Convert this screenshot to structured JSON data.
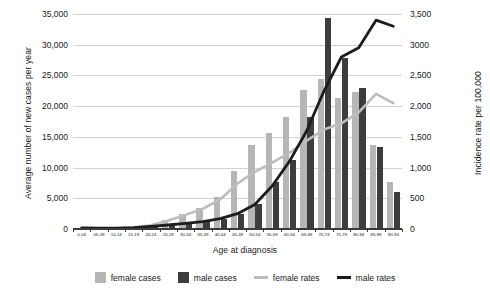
{
  "chart_data": {
    "type": "bar",
    "title": "",
    "xlabel": "Age at diagnosis",
    "ylabel": "Average number of new cases per year",
    "y2label": "Incidence rate per 100,000",
    "ylim": [
      0,
      35000
    ],
    "y2lim": [
      0,
      3500
    ],
    "grid": true,
    "legend_position": "bottom",
    "categories": [
      "0-04",
      "05-09",
      "10-14",
      "15-19",
      "20-24",
      "25-29",
      "30-34",
      "35-39",
      "40-44",
      "45-49",
      "50-54",
      "55-59",
      "60-64",
      "65-69",
      "70-74",
      "75-79",
      "80-84",
      "85-89",
      "90-94"
    ],
    "yticks": [
      "0",
      "5,000",
      "10,000",
      "15,000",
      "20,000",
      "25,000",
      "30,000",
      "35,000"
    ],
    "y2ticks": [
      "0",
      "500",
      "1,000",
      "1,500",
      "2,000",
      "2,500",
      "3000",
      "3,500"
    ],
    "series": [
      {
        "name": "female cases",
        "type": "bar",
        "axis": "left",
        "color": "#b6b6b6",
        "values": [
          130,
          90,
          110,
          250,
          600,
          1450,
          2400,
          3500,
          5200,
          9500,
          13700,
          15600,
          18200,
          22700,
          24400,
          21400,
          22300,
          13700,
          7600
        ]
      },
      {
        "name": "male cases",
        "type": "bar",
        "axis": "left",
        "color": "#3d3d3d",
        "values": [
          160,
          110,
          130,
          250,
          450,
          700,
          950,
          1250,
          1700,
          2400,
          4000,
          7700,
          11200,
          18300,
          34300,
          27800,
          23000,
          13300,
          6000
        ]
      },
      {
        "name": "female rates",
        "type": "line",
        "axis": "right",
        "color": "#bdbdbd",
        "values": [
          15,
          10,
          12,
          25,
          60,
          140,
          230,
          330,
          480,
          740,
          930,
          1080,
          1240,
          1440,
          1620,
          1720,
          1900,
          2200,
          2050
        ]
      },
      {
        "name": "male rates",
        "type": "line",
        "axis": "right",
        "color": "#1c1c1c",
        "values": [
          18,
          12,
          14,
          24,
          42,
          65,
          90,
          120,
          170,
          250,
          400,
          700,
          1100,
          1600,
          2250,
          2800,
          2950,
          3400,
          3300
        ]
      }
    ]
  },
  "legend": {
    "items": [
      {
        "label": "female cases",
        "marker": "box-light-gray"
      },
      {
        "label": "male cases",
        "marker": "box-black"
      },
      {
        "label": "female rates",
        "marker": "line-light-gray"
      },
      {
        "label": "male rates",
        "marker": "line-black"
      }
    ]
  }
}
